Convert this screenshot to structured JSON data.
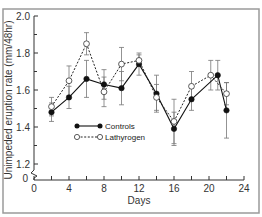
{
  "chart_data": {
    "type": "line",
    "title": "",
    "xlabel": "Days",
    "ylabel": "Unimpeded eruption rate (mm/48hr)",
    "xlim": [
      0,
      24
    ],
    "ylim": [
      1.1,
      2.0
    ],
    "y_axis_break": true,
    "y_axis_origin_label": "0",
    "x_ticks": [
      0,
      4,
      8,
      12,
      16,
      20,
      24
    ],
    "x_minor_ticks": [
      2,
      6,
      10,
      14,
      18,
      22
    ],
    "x_tick_labels": [
      "0",
      "4",
      "8",
      "12",
      "16",
      "20",
      "24"
    ],
    "y_ticks": [
      1.2,
      1.4,
      1.6,
      1.8,
      2.0
    ],
    "y_minor_ticks": [
      1.3,
      1.5,
      1.7,
      1.9
    ],
    "y_tick_labels": [
      "1.2",
      "1.4",
      "1.6",
      "1.8",
      "2.0"
    ],
    "grid": false,
    "legend_position": "center-left",
    "series": [
      {
        "name": "Controls",
        "marker": "filled-circle",
        "line": "solid",
        "x": [
          2,
          4,
          6,
          8,
          10,
          12,
          14,
          16,
          18,
          21,
          22
        ],
        "values": [
          1.48,
          1.56,
          1.66,
          1.63,
          1.61,
          1.74,
          1.58,
          1.39,
          1.55,
          1.68,
          1.49
        ],
        "error": [
          0.05,
          0.06,
          0.1,
          0.08,
          0.09,
          0.06,
          0.1,
          0.09,
          0.06,
          0.08,
          0.15
        ]
      },
      {
        "name": "Lathyrogen",
        "marker": "open-circle",
        "line": "dotted",
        "x": [
          2,
          4,
          6,
          8,
          10,
          12,
          14,
          16,
          18,
          20.2,
          22
        ],
        "values": [
          1.51,
          1.65,
          1.85,
          1.59,
          1.74,
          1.76,
          1.56,
          1.43,
          1.62,
          1.68,
          1.58
        ],
        "error": [
          0.05,
          0.08,
          0.06,
          0.08,
          0.09,
          0.03,
          0.07,
          0.12,
          0.08,
          0.08,
          0.06
        ]
      }
    ]
  }
}
